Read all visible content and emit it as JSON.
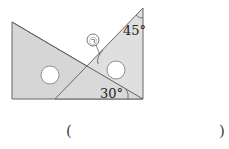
{
  "diagram": {
    "angle_left_triangle": "30°",
    "angle_right_triangle": "45°",
    "unknown_angle_label": "㉠",
    "fill_color": "#d6d6d6",
    "stroke_color": "#666666"
  },
  "answer": {
    "open_paren": "(",
    "close_paren": ")"
  }
}
